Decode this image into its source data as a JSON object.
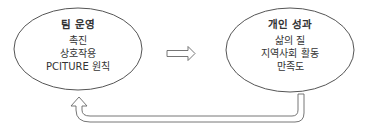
{
  "diagram": {
    "nodes": [
      {
        "id": "team-operation",
        "title": "팀 운영",
        "items": [
          "촉진",
          "상호작용",
          "PCITURE 원칙"
        ]
      },
      {
        "id": "individual-outcome",
        "title": "개인 성과",
        "items": [
          "삶의 질",
          "지역사회 활동",
          "만족도"
        ]
      }
    ],
    "edges": [
      {
        "from": "team-operation",
        "to": "individual-outcome",
        "style": "hollow-block-arrow"
      },
      {
        "from": "individual-outcome",
        "to": "team-operation",
        "style": "hollow-curved-feedback-arrow"
      }
    ],
    "colors": {
      "stroke": "#555555",
      "text": "#333333",
      "background": "#ffffff"
    }
  }
}
